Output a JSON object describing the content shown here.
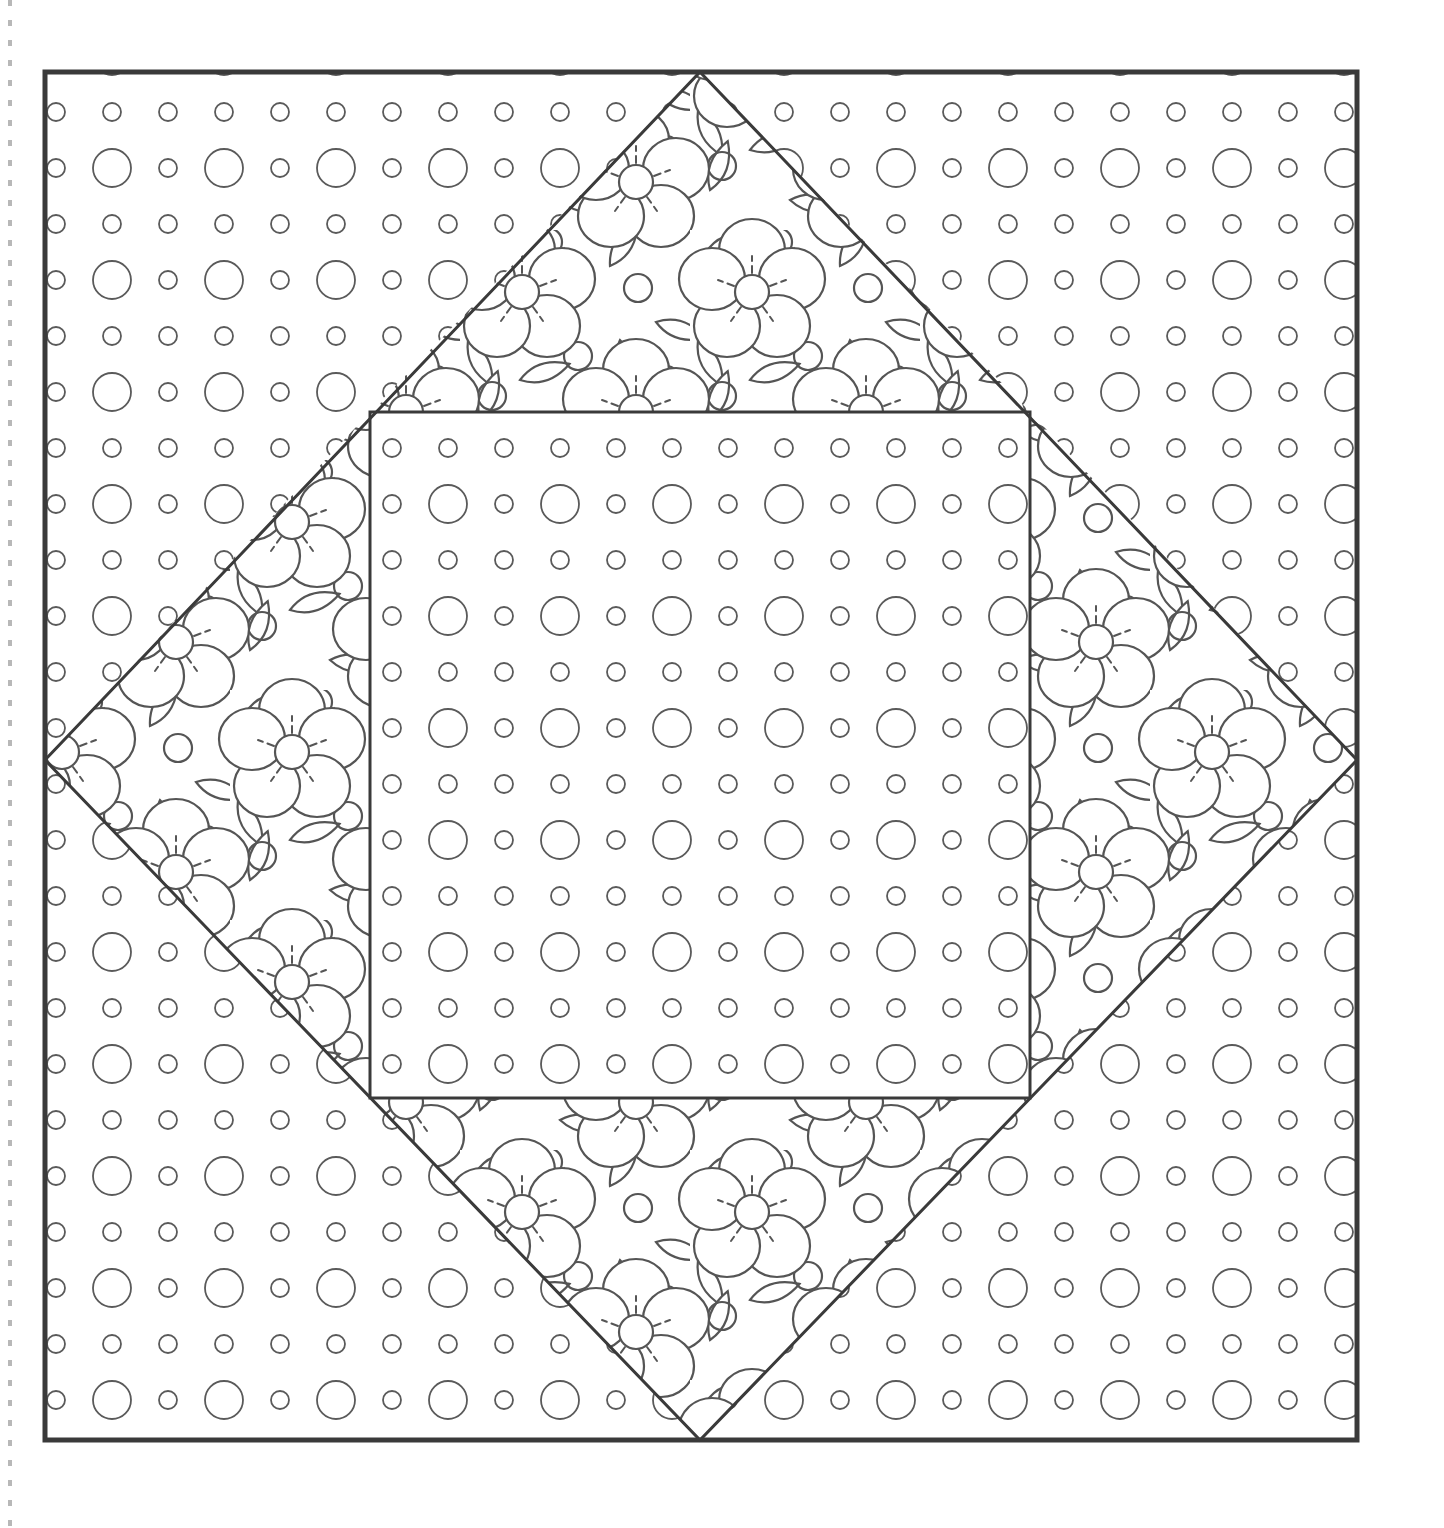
{
  "page": {
    "background_color": "#ffffff",
    "width": 1444,
    "height": 1528
  },
  "ink": {
    "border_color": "#3a3a3a",
    "pattern_color": "#555555",
    "dot_color": "#5a5a5a",
    "perforation_color": "#b8b8b8",
    "border_width": 5,
    "inner_line_width": 3,
    "pattern_line_width": 2.2,
    "dot_line_width": 1.8
  },
  "block": {
    "name": "square-in-a-square quilt block",
    "outer_square": {
      "label": "outer square border",
      "x": 45,
      "y": 72,
      "width": 1312,
      "height": 1368
    },
    "diamond": {
      "label": "on-point square (floral fabric)",
      "top_vertex": {
        "x": 700,
        "y": 72
      },
      "right_vertex": {
        "x": 1357,
        "y": 760
      },
      "bottom_vertex": {
        "x": 700,
        "y": 1440
      },
      "left_vertex": {
        "x": 45,
        "y": 760
      }
    },
    "inner_square": {
      "label": "center square (polka dot fabric)",
      "x": 370,
      "y": 412,
      "width": 660,
      "height": 686
    },
    "corner_triangles": [
      {
        "name": "corner-triangle-top-left",
        "fabric": "polka-dot"
      },
      {
        "name": "corner-triangle-top-right",
        "fabric": "polka-dot"
      },
      {
        "name": "corner-triangle-bottom-right",
        "fabric": "polka-dot"
      },
      {
        "name": "corner-triangle-bottom-left",
        "fabric": "polka-dot"
      }
    ],
    "diamond_triangles": [
      {
        "name": "diamond-triangle-top",
        "fabric": "floral"
      },
      {
        "name": "diamond-triangle-right",
        "fabric": "floral"
      },
      {
        "name": "diamond-triangle-bottom",
        "fabric": "floral"
      },
      {
        "name": "diamond-triangle-left",
        "fabric": "floral"
      }
    ]
  },
  "fabrics": {
    "polka_dot": {
      "name": "polka-dot-fabric",
      "grid_spacing_x": 56,
      "grid_spacing_y": 56,
      "small_dot_radius": 9,
      "large_dot_radius": 19,
      "pattern": "alternating rows: plain small dots / alternating large-small dots"
    },
    "floral": {
      "name": "floral-fabric",
      "motifs": [
        "five-petal-flower",
        "pointed-leaf",
        "small-circle"
      ],
      "flower_petal_count": 5,
      "flower_center_radius": 17,
      "flower_stamen_dashes": 5,
      "tile_size": 230,
      "circle_radius": 14
    }
  },
  "page_marks": {
    "left_perforation": {
      "name": "page-perforation-line",
      "x": 10,
      "dash": "6 14",
      "y_start": 0,
      "y_end": 1528
    }
  }
}
